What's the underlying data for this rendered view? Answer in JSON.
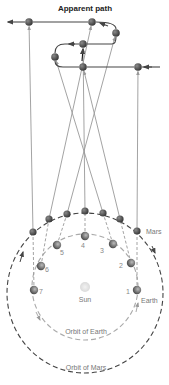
{
  "title": "Apparent path",
  "colors": {
    "mars_dot": "#4a4a4a",
    "earth_dot": "#6a6a6a",
    "sun": "#dddddd",
    "sight_line": "#999999",
    "path_line": "#444444",
    "mars_orbit": "#444444",
    "earth_orbit": "#aaaaaa"
  },
  "labels": {
    "mars": "Mars",
    "earth": "Earth",
    "sun": "Sun",
    "orbit_earth": "Orbit of Earth",
    "orbit_mars": "Orbit of Mars"
  },
  "sun": {
    "x": 85,
    "y": 287,
    "r": 5
  },
  "orbits": {
    "earth": {
      "cx": 85,
      "cy": 287,
      "rx": 53,
      "ry": 53
    },
    "mars": {
      "cx": 85,
      "cy": 293,
      "rx": 78,
      "ry": 80
    }
  },
  "positions": [
    {
      "n": "1",
      "earth": [
        137,
        290
      ],
      "mars": [
        137,
        231
      ],
      "apparent": [
        138,
        67
      ]
    },
    {
      "n": "2",
      "earth": [
        131,
        263
      ],
      "mars": [
        120,
        219
      ],
      "apparent": [
        83,
        67
      ]
    },
    {
      "n": "3",
      "earth": [
        113,
        244
      ],
      "mars": [
        103,
        213
      ],
      "apparent": [
        55,
        57
      ]
    },
    {
      "n": "4",
      "earth": [
        85,
        236
      ],
      "mars": [
        85,
        211
      ],
      "apparent": [
        83,
        44
      ]
    },
    {
      "n": "5",
      "earth": [
        57,
        245
      ],
      "mars": [
        67,
        214
      ],
      "apparent": [
        116,
        33
      ]
    },
    {
      "n": "6",
      "earth": [
        41,
        266
      ],
      "mars": [
        49,
        219
      ],
      "apparent": [
        92,
        22
      ]
    },
    {
      "n": "7",
      "earth": [
        34,
        290
      ],
      "mars": [
        33,
        232
      ],
      "apparent": [
        29,
        22
      ]
    }
  ],
  "number_label_offsets": [
    [
      -9,
      2
    ],
    [
      -10,
      3
    ],
    [
      -11,
      7
    ],
    [
      -2,
      10
    ],
    [
      5,
      8
    ],
    [
      6,
      4
    ],
    [
      7,
      2
    ]
  ]
}
